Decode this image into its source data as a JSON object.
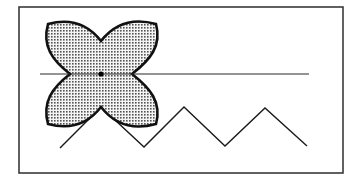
{
  "figure": {
    "colors": {
      "background": "#ffffff",
      "stroke": "#1a1a1a",
      "frame": "#3a3a3a",
      "fill_dot": "#555555",
      "fill_bg": "#f2f2f2"
    },
    "frame": {
      "x": 19,
      "y": 7,
      "width": 324,
      "height": 166
    },
    "horizontal_line": {
      "x1": 40,
      "y1": 74,
      "x2": 309,
      "y2": 74
    },
    "flower": {
      "center": [
        101,
        74
      ],
      "corners": [
        [
          48,
          24
        ],
        [
          156,
          24
        ],
        [
          156,
          124
        ],
        [
          48,
          124
        ]
      ],
      "notches": [
        [
          101,
          41
        ],
        [
          132,
          74
        ],
        [
          101,
          107
        ],
        [
          70,
          74
        ]
      ]
    },
    "zigzag": {
      "points": [
        [
          60,
          148
        ],
        [
          101,
          107
        ],
        [
          144,
          147
        ],
        [
          184,
          107
        ],
        [
          225,
          146
        ],
        [
          265,
          108
        ],
        [
          307,
          146
        ]
      ]
    }
  }
}
